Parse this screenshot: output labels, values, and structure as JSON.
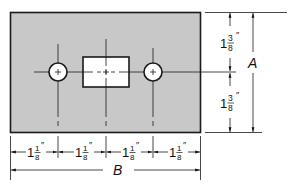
{
  "diagram": {
    "type": "mechanical-drawing",
    "plate": {
      "fill": "#c8c8c8",
      "stroke": "#1a1a1a"
    },
    "cutout": {
      "fill": "#ffffff"
    },
    "dimensions": {
      "vertical": [
        {
          "whole": "1",
          "num": "3",
          "den": "8",
          "unit": "″"
        },
        {
          "whole": "1",
          "num": "3",
          "den": "8",
          "unit": "″"
        }
      ],
      "vertical_total_label": "A",
      "horizontal": [
        {
          "whole": "1",
          "num": "1",
          "den": "8",
          "unit": "″"
        },
        {
          "whole": "1",
          "num": "1",
          "den": "8",
          "unit": "″"
        },
        {
          "whole": "1",
          "num": "1",
          "den": "8",
          "unit": "″"
        },
        {
          "whole": "1",
          "num": "1",
          "den": "8",
          "unit": "″"
        }
      ],
      "horizontal_total_label": "B"
    }
  }
}
